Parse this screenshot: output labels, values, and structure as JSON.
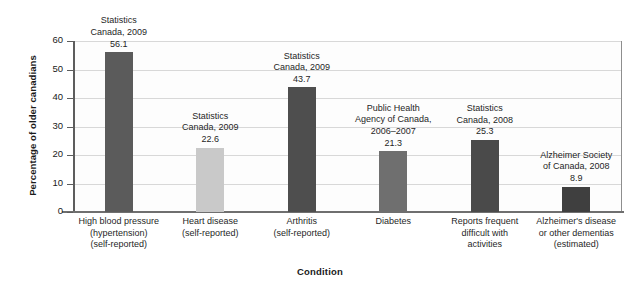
{
  "chart_data": {
    "type": "bar",
    "title": "",
    "xlabel": "Condition",
    "ylabel": "Percentage of older canadians",
    "ylim": [
      0,
      60
    ],
    "yticks": [
      0,
      10,
      20,
      30,
      40,
      50,
      60
    ],
    "grid": true,
    "legend": "none",
    "categories": [
      "High blood pressure\n(hypertension)\n(self-reported)",
      "Heart disease\n(self-reported)",
      "Arthritis\n(self-reported)",
      "Diabetes",
      "Reports frequent\ndifficult with\nactivities",
      "Alzheimer's disease\nor other dementias\n(estimated)"
    ],
    "values": [
      56.1,
      22.6,
      43.7,
      21.3,
      25.3,
      8.9
    ],
    "annotations": [
      "Statistics\nCanada, 2009\n56.1",
      "Statistics\nCanada, 2009\n22.6",
      "Statistics\nCanada, 2009\n43.7",
      "Public Health\nAgency of Canada,\n2006–2007\n21.3",
      "Statistics\nCanada, 2008\n25.3",
      "Alzheimer Society\nof Canada, 2008\n8.9"
    ],
    "bar_colors": [
      "#5b5b5b",
      "#c9c9c9",
      "#4e4e4e",
      "#6f6f6f",
      "#4a4a4a",
      "#3f3f3f"
    ],
    "sources": [
      "Statistics Canada, 2009",
      "Statistics Canada, 2009",
      "Statistics Canada, 2009",
      "Public Health Agency of Canada, 2006–2007",
      "Statistics Canada, 2008",
      "Alzheimer Society of Canada, 2008"
    ]
  },
  "axis": {
    "y_tick_labels": [
      "0",
      "10",
      "20",
      "30",
      "40",
      "50",
      "60"
    ],
    "x_title": "Condition",
    "y_title": "Percentage of older canadians"
  },
  "colors": {
    "gridline": "#d8d8d8",
    "axis": "#5d5d5d",
    "plot_border": "#8e8e8e",
    "background": "#ffffff",
    "text": "#1a1a1a"
  }
}
